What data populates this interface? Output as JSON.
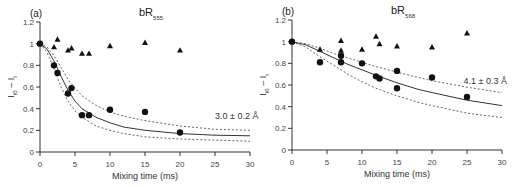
{
  "chart_data": [
    {
      "type": "scatter",
      "panel_label": "(a)",
      "title": "bR",
      "title_subscript": "555",
      "xlabel": "Mixing time (ms)",
      "ylabel": "I_t0 - I_t",
      "xlim": [
        0,
        30
      ],
      "ylim": [
        0,
        1.2
      ],
      "xticks": [
        0,
        5,
        10,
        15,
        20,
        25,
        30
      ],
      "xtick_labels": [
        "0",
        "5",
        "10",
        "15",
        "20",
        "25",
        "30"
      ],
      "yticks": [
        0,
        0.2,
        0.4,
        0.6,
        0.8,
        1,
        1.2
      ],
      "ytick_labels": [
        "0",
        "0.2",
        "0.4",
        "0.6",
        "0.8",
        "1",
        "1.2"
      ],
      "annotation": "3.0 ± 0.2 Å",
      "annotation_pos": [
        25,
        0.33
      ],
      "series": [
        {
          "name": "circles",
          "marker": "circle",
          "x": [
            0,
            2,
            2.5,
            4,
            4.5,
            6,
            7,
            10,
            15,
            20
          ],
          "y": [
            1.0,
            0.8,
            0.73,
            0.54,
            0.59,
            0.34,
            0.34,
            0.39,
            0.37,
            0.18
          ]
        },
        {
          "name": "triangles",
          "marker": "triangle",
          "x": [
            0,
            2,
            2.5,
            4,
            4.5,
            6,
            7,
            10,
            15,
            20
          ],
          "y": [
            1.0,
            0.97,
            1.04,
            0.94,
            0.96,
            0.91,
            0.91,
            0.98,
            1.01,
            0.94
          ]
        },
        {
          "name": "fit",
          "line": "solid",
          "x": [
            0,
            1,
            2,
            3,
            4,
            5,
            6,
            8,
            10,
            12,
            15,
            20,
            25,
            30
          ],
          "y": [
            1.0,
            0.95,
            0.84,
            0.7,
            0.57,
            0.47,
            0.4,
            0.32,
            0.27,
            0.23,
            0.2,
            0.17,
            0.155,
            0.15
          ]
        },
        {
          "name": "upper bound",
          "line": "dashed",
          "x": [
            0,
            1,
            2,
            3,
            4,
            5,
            6,
            8,
            10,
            12,
            15,
            20,
            25,
            30
          ],
          "y": [
            1.0,
            0.97,
            0.89,
            0.78,
            0.67,
            0.59,
            0.52,
            0.43,
            0.37,
            0.33,
            0.29,
            0.24,
            0.21,
            0.2
          ]
        },
        {
          "name": "lower bound",
          "line": "dashed",
          "x": [
            0,
            1,
            2,
            3,
            4,
            5,
            6,
            8,
            10,
            12,
            15,
            20,
            25,
            30
          ],
          "y": [
            1.0,
            0.92,
            0.77,
            0.6,
            0.47,
            0.38,
            0.32,
            0.24,
            0.2,
            0.17,
            0.14,
            0.12,
            0.11,
            0.1
          ]
        }
      ]
    },
    {
      "type": "scatter",
      "panel_label": "(b)",
      "title": "bR",
      "title_subscript": "568",
      "xlabel": "Mixing time (ms)",
      "ylabel": "I_t0 - I_t",
      "xlim": [
        0,
        30
      ],
      "ylim": [
        0,
        1.2
      ],
      "xticks": [
        0,
        5,
        10,
        15,
        20,
        25,
        30
      ],
      "xtick_labels": [
        "0",
        "5",
        "10",
        "15",
        "20",
        "25",
        "30"
      ],
      "yticks": [
        0,
        0.2,
        0.4,
        0.6,
        0.8,
        1,
        1.2
      ],
      "ytick_labels": [
        "0",
        "0.2",
        "0.4",
        "0.6",
        "0.8",
        "1",
        "1.2"
      ],
      "annotation": "4.1 ± 0.3 Å",
      "annotation_pos": [
        24.5,
        0.64
      ],
      "series": [
        {
          "name": "circles",
          "marker": "circle",
          "x": [
            0,
            4,
            7,
            7,
            10,
            12,
            12.5,
            15,
            15,
            20,
            25
          ],
          "y": [
            1.0,
            0.81,
            0.87,
            0.81,
            0.8,
            0.68,
            0.66,
            0.73,
            0.57,
            0.67,
            0.49
          ]
        },
        {
          "name": "triangles",
          "marker": "triangle",
          "x": [
            0,
            4,
            7,
            7,
            10,
            12,
            12.5,
            15,
            20,
            25
          ],
          "y": [
            1.0,
            0.93,
            1.01,
            0.92,
            0.93,
            1.05,
            0.98,
            0.96,
            0.95,
            1.08
          ]
        },
        {
          "name": "fit",
          "line": "solid",
          "x": [
            0,
            2,
            4,
            6,
            8,
            10,
            12,
            15,
            18,
            20,
            25,
            30
          ],
          "y": [
            1.0,
            0.97,
            0.91,
            0.85,
            0.79,
            0.74,
            0.69,
            0.62,
            0.56,
            0.53,
            0.46,
            0.41
          ]
        },
        {
          "name": "upper bound",
          "line": "dashed",
          "x": [
            0,
            2,
            4,
            6,
            8,
            10,
            12,
            15,
            18,
            20,
            25,
            30
          ],
          "y": [
            1.0,
            0.98,
            0.94,
            0.89,
            0.85,
            0.81,
            0.77,
            0.72,
            0.67,
            0.64,
            0.58,
            0.53
          ]
        },
        {
          "name": "lower bound",
          "line": "dashed",
          "x": [
            0,
            2,
            4,
            6,
            8,
            10,
            12,
            15,
            18,
            20,
            25,
            30
          ],
          "y": [
            1.0,
            0.95,
            0.86,
            0.78,
            0.7,
            0.63,
            0.57,
            0.5,
            0.44,
            0.41,
            0.34,
            0.3
          ]
        }
      ]
    }
  ],
  "layout": {
    "panels": [
      {
        "x0": 40,
        "x1": 250,
        "y0": 152,
        "y1": 22
      },
      {
        "x0": 292,
        "x1": 502,
        "y0": 150,
        "y1": 20
      }
    ]
  }
}
